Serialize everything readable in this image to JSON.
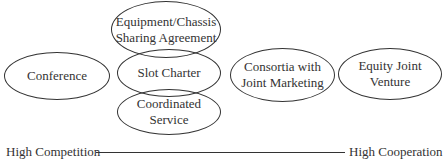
{
  "diagram": {
    "nodes": [
      {
        "id": "conference",
        "lines": [
          "Conference"
        ]
      },
      {
        "id": "equipment",
        "lines": [
          "Equipment/Chassis",
          "Sharing Agreement"
        ]
      },
      {
        "id": "slot",
        "lines": [
          "Slot Charter"
        ]
      },
      {
        "id": "coordinated",
        "lines": [
          "Coordinated",
          "Service"
        ]
      },
      {
        "id": "consortia",
        "lines": [
          "Consortia with",
          "Joint Marketing"
        ]
      },
      {
        "id": "equity",
        "lines": [
          "Equity Joint",
          "Venture"
        ]
      }
    ],
    "axis": {
      "left_label": "High Competition",
      "right_label": "High Cooperation"
    }
  }
}
